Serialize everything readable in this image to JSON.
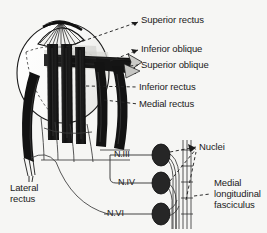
{
  "figure": {
    "background_color": "#f6f6f4",
    "ink_color": "#1b1b1b",
    "muscle_color": "#161616",
    "nucleus_color": "#262626"
  },
  "muscle_labels": [
    {
      "id": "superior-rectus",
      "text": "Superior rectus",
      "x": 141,
      "y": 18
    },
    {
      "id": "inferior-oblique",
      "text": "Inferior oblique",
      "x": 141,
      "y": 47
    },
    {
      "id": "superior-oblique",
      "text": "Superior oblique",
      "x": 141,
      "y": 62
    },
    {
      "id": "inferior-rectus",
      "text": "Inferior rectus",
      "x": 141,
      "y": 84
    },
    {
      "id": "medial-rectus",
      "text": "Medial rectus",
      "x": 141,
      "y": 101
    }
  ],
  "lateral_rectus": {
    "id": "lateral-rectus",
    "line1": "Lateral",
    "line2": "rectus",
    "x": 10,
    "y": 187
  },
  "nerve_labels": [
    {
      "id": "nerve-3",
      "text": "N.III",
      "x": 115,
      "y": 152
    },
    {
      "id": "nerve-4",
      "text": "N.IV",
      "x": 119,
      "y": 180
    },
    {
      "id": "nerve-6",
      "text": "N.VI",
      "x": 108,
      "y": 213
    }
  ],
  "nuclei_label": {
    "id": "nuclei",
    "text": "Nuclei",
    "x": 199,
    "y": 146
  },
  "mlf_label": {
    "id": "medial-longitudinal-fasciculus",
    "line1": "Medial",
    "line2": "longitudinal",
    "line3": "fasciculus",
    "x": 214,
    "y": 182
  },
  "nuclei_markers": [
    {
      "id": "nucleus-oculomotor",
      "cx": 161,
      "cy": 155,
      "rx": 9,
      "ry": 11
    },
    {
      "id": "nucleus-trochlear",
      "cx": 161,
      "cy": 183,
      "rx": 9,
      "ry": 11
    },
    {
      "id": "nucleus-abducens",
      "cx": 161,
      "cy": 214,
      "rx": 9,
      "ry": 11
    }
  ]
}
